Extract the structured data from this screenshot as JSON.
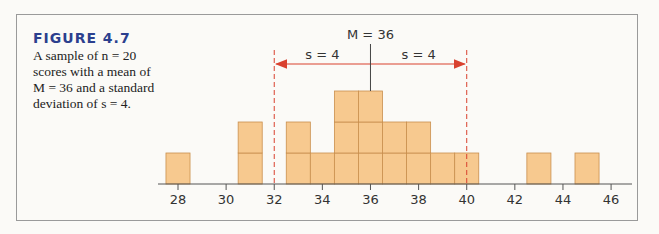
{
  "figure": {
    "label": "FIGURE 4.7",
    "caption": "A sample of n = 20 scores with a mean of M = 36 and a standard deviation of s = 4."
  },
  "colors": {
    "bar_fill": "#f7c98f",
    "bar_stroke": "#c98f4e",
    "sd_line": "#d9412f",
    "label_blue": "#2b3f8e"
  },
  "annotations": {
    "mean_label": "M = 36",
    "sd_left_label": "s = 4",
    "sd_right_label": "s = 4"
  },
  "chart_data": {
    "type": "bar",
    "title": "FIGURE 4.7",
    "subtitle": "A sample of n = 20 scores with a mean of M = 36 and a standard deviation of s = 4.",
    "xlabel": "",
    "ylabel": "",
    "x": [
      28,
      31,
      33,
      34,
      35,
      36,
      37,
      38,
      39,
      40,
      43,
      45
    ],
    "values": [
      1,
      2,
      2,
      1,
      3,
      3,
      2,
      2,
      1,
      1,
      1,
      1
    ],
    "xticks": [
      28,
      30,
      32,
      34,
      36,
      38,
      40,
      42,
      44,
      46
    ],
    "xlim": [
      27,
      47
    ],
    "ylim": [
      0,
      3
    ],
    "grid": false,
    "legend": "none",
    "mean": 36,
    "sd": 4,
    "sd_markers": [
      32,
      40
    ],
    "annotations": [
      "M = 36",
      "s = 4",
      "s = 4"
    ],
    "n": 20
  }
}
